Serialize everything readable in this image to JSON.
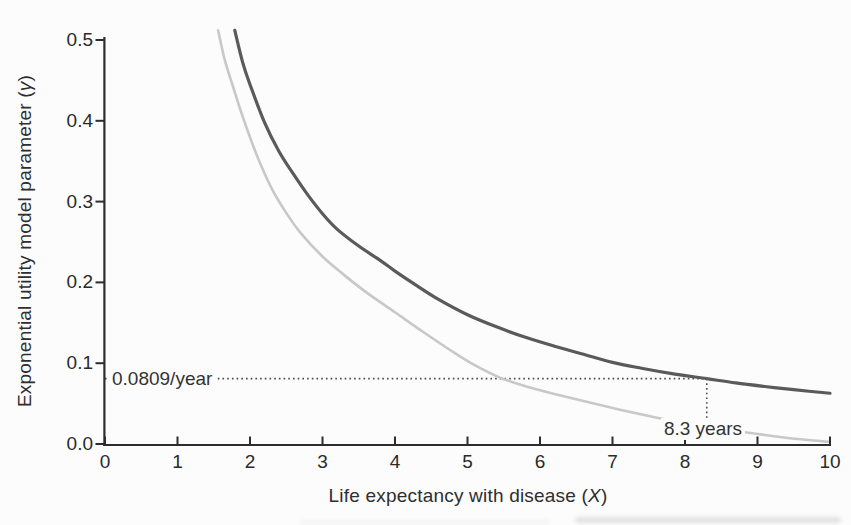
{
  "labels": {
    "y_prefix": "Exponential utility model parameter (",
    "y_var": "γ",
    "y_suffix": ")",
    "x_prefix": "Life expectancy with disease (",
    "x_var": "X",
    "x_suffix": ")",
    "gamma_annotation": "0.0809/year",
    "years_annotation": "8.3 years"
  },
  "colors": {
    "background": "#fcfcfc",
    "axis": "#2d2d2d",
    "dark_curve": "#5a5a5a",
    "light_curve": "#c8c8c8",
    "dotted_line": "#4a4a4a",
    "text": "#2e2e2e"
  },
  "chart_data": {
    "type": "line",
    "title": "",
    "xlabel": "Life expectancy with disease (X)",
    "ylabel": "Exponential utility model parameter (γ)",
    "xlim": [
      0,
      10
    ],
    "ylim": [
      0,
      0.5
    ],
    "grid": false,
    "legend": "none",
    "x_ticks": [
      0,
      1,
      2,
      3,
      4,
      5,
      6,
      7,
      8,
      9,
      10
    ],
    "x_tick_labels": [
      "0",
      "1",
      "2",
      "3",
      "4",
      "5",
      "6",
      "7",
      "8",
      "9",
      "10"
    ],
    "y_ticks": [
      0.0,
      0.1,
      0.2,
      0.3,
      0.4,
      0.5
    ],
    "y_tick_labels": [
      "0.0",
      "0.1",
      "0.2",
      "0.3",
      "0.4",
      "0.5"
    ],
    "series": [
      {
        "name": "upper-dark-curve",
        "color": "#5a5a5a",
        "width": 3.2,
        "points": [
          [
            1.79,
            0.512
          ],
          [
            1.9,
            0.472
          ],
          [
            2.0,
            0.445
          ],
          [
            2.2,
            0.398
          ],
          [
            2.4,
            0.362
          ],
          [
            2.6,
            0.334
          ],
          [
            2.8,
            0.308
          ],
          [
            3.0,
            0.285
          ],
          [
            3.2,
            0.266
          ],
          [
            3.5,
            0.245
          ],
          [
            3.8,
            0.227
          ],
          [
            4.0,
            0.214
          ],
          [
            4.3,
            0.196
          ],
          [
            4.6,
            0.179
          ],
          [
            5.0,
            0.16
          ],
          [
            5.4,
            0.145
          ],
          [
            5.8,
            0.132
          ],
          [
            6.2,
            0.121
          ],
          [
            6.6,
            0.111
          ],
          [
            7.0,
            0.101
          ],
          [
            7.4,
            0.0938
          ],
          [
            7.8,
            0.0875
          ],
          [
            8.3,
            0.0809
          ],
          [
            8.7,
            0.0756
          ],
          [
            9.1,
            0.0712
          ],
          [
            9.5,
            0.0672
          ],
          [
            10.0,
            0.0628
          ]
        ]
      },
      {
        "name": "lower-light-curve",
        "color": "#c8c8c8",
        "width": 2.6,
        "points": [
          [
            1.56,
            0.512
          ],
          [
            1.65,
            0.476
          ],
          [
            1.76,
            0.444
          ],
          [
            1.9,
            0.405
          ],
          [
            2.1,
            0.356
          ],
          [
            2.3,
            0.316
          ],
          [
            2.5,
            0.286
          ],
          [
            2.7,
            0.261
          ],
          [
            3.0,
            0.232
          ],
          [
            3.3,
            0.209
          ],
          [
            3.6,
            0.188
          ],
          [
            4.0,
            0.163
          ],
          [
            4.4,
            0.138
          ],
          [
            4.8,
            0.114
          ],
          [
            5.1,
            0.0975
          ],
          [
            5.45,
            0.082
          ],
          [
            5.8,
            0.0715
          ],
          [
            6.2,
            0.062
          ],
          [
            6.7,
            0.051
          ],
          [
            7.2,
            0.0405
          ],
          [
            7.7,
            0.031
          ],
          [
            8.2,
            0.023
          ],
          [
            8.7,
            0.016
          ],
          [
            9.2,
            0.01
          ],
          [
            9.6,
            0.0058
          ],
          [
            10.0,
            0.0025
          ]
        ]
      }
    ],
    "annotations": [
      {
        "name": "gamma-guide",
        "type": "dotted-horizontal",
        "y": 0.0809,
        "from_x": 0,
        "to_x": 8.3,
        "label": "0.0809/year"
      },
      {
        "name": "years-guide",
        "type": "dotted-vertical",
        "x": 8.3,
        "from_y": 0.0809,
        "label": "8.3 years"
      }
    ]
  }
}
